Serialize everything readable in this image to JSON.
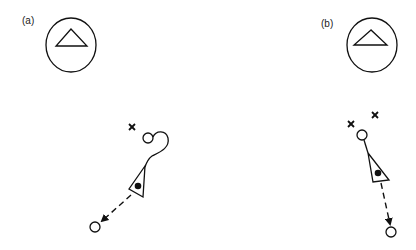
{
  "figure": {
    "panels": [
      {
        "label": "(a)",
        "landmark": "circle-with-triangle",
        "markers": [
          "x"
        ],
        "path": "curved-hook",
        "agent": "triangle-with-dot",
        "movement": "dashed-arrow"
      },
      {
        "label": "(b)",
        "landmark": "circle-with-triangle",
        "markers": [
          "x",
          "x"
        ],
        "path": "straight",
        "agent": "triangle-with-dot",
        "movement": "dashed-arrow"
      }
    ]
  }
}
